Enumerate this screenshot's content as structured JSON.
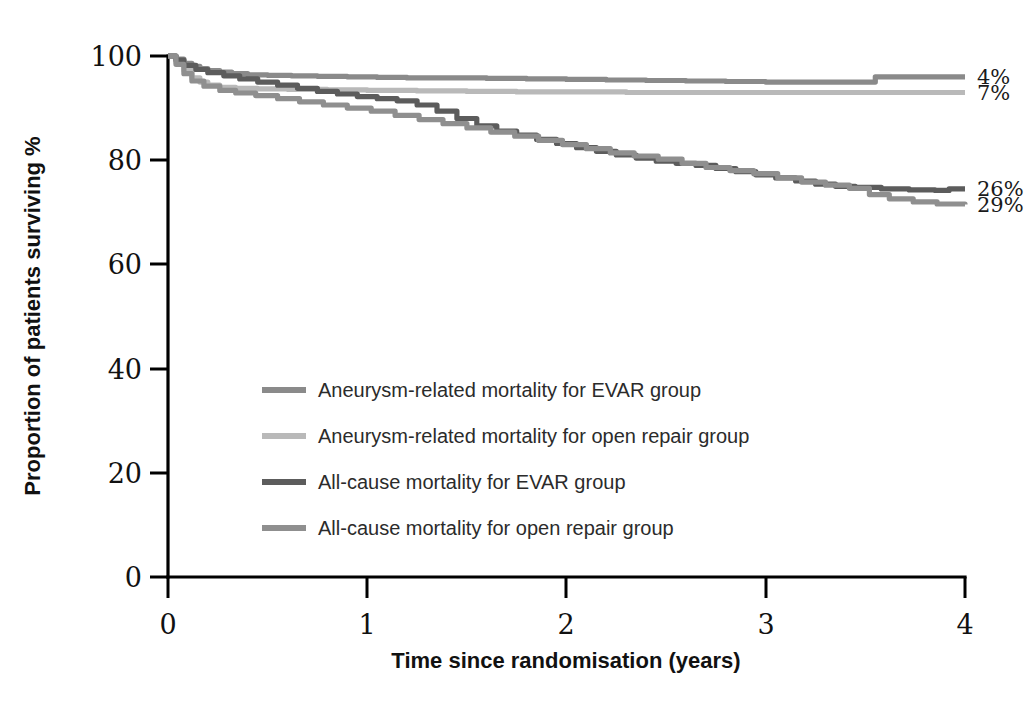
{
  "chart_data": {
    "type": "line",
    "title": "",
    "xlabel": "Time since randomisation (years)",
    "ylabel": "Proportion of patients surviving %",
    "xlim": [
      0,
      4
    ],
    "ylim": [
      0,
      100
    ],
    "xticks": [
      "0",
      "1",
      "2",
      "3",
      "4"
    ],
    "yticks": [
      "0",
      "20",
      "40",
      "60",
      "80",
      "100"
    ],
    "grid": false,
    "legend_position": "center-left",
    "series": [
      {
        "name": "Aneurysm-related mortality for EVAR group",
        "color": "#8a8a8a",
        "end_label": "4%",
        "points": [
          [
            0.0,
            100.0
          ],
          [
            0.04,
            99.4
          ],
          [
            0.08,
            98.6
          ],
          [
            0.12,
            98.0
          ],
          [
            0.16,
            97.6
          ],
          [
            0.2,
            97.2
          ],
          [
            0.26,
            96.9
          ],
          [
            0.32,
            96.6
          ],
          [
            0.4,
            96.4
          ],
          [
            0.5,
            96.3
          ],
          [
            0.62,
            96.2
          ],
          [
            0.75,
            96.1
          ],
          [
            0.9,
            96.0
          ],
          [
            1.05,
            95.9
          ],
          [
            1.2,
            95.8
          ],
          [
            1.4,
            95.8
          ],
          [
            1.6,
            95.7
          ],
          [
            1.8,
            95.6
          ],
          [
            2.0,
            95.5
          ],
          [
            2.2,
            95.4
          ],
          [
            2.4,
            95.3
          ],
          [
            2.6,
            95.2
          ],
          [
            2.8,
            95.1
          ],
          [
            3.0,
            95.0
          ],
          [
            3.3,
            95.0
          ],
          [
            3.55,
            96.0
          ],
          [
            3.8,
            96.0
          ],
          [
            4.0,
            96.0
          ]
        ]
      },
      {
        "name": "Aneurysm-related mortality for open repair group",
        "color": "#b9b9b9",
        "end_label": "7%",
        "points": [
          [
            0.0,
            100.0
          ],
          [
            0.04,
            98.8
          ],
          [
            0.08,
            97.2
          ],
          [
            0.12,
            95.8
          ],
          [
            0.16,
            95.0
          ],
          [
            0.2,
            94.4
          ],
          [
            0.26,
            94.0
          ],
          [
            0.34,
            93.8
          ],
          [
            0.45,
            93.7
          ],
          [
            0.6,
            93.6
          ],
          [
            0.8,
            93.5
          ],
          [
            1.0,
            93.4
          ],
          [
            1.25,
            93.3
          ],
          [
            1.5,
            93.2
          ],
          [
            1.75,
            93.1
          ],
          [
            2.0,
            93.1
          ],
          [
            2.3,
            93.0
          ],
          [
            2.6,
            93.0
          ],
          [
            2.9,
            93.0
          ],
          [
            3.2,
            93.0
          ],
          [
            3.5,
            93.0
          ],
          [
            3.75,
            93.0
          ],
          [
            4.0,
            93.0
          ]
        ]
      },
      {
        "name": "All-cause mortality for EVAR group",
        "color": "#5c5c5c",
        "end_label": "26%",
        "points": [
          [
            0.0,
            100.0
          ],
          [
            0.04,
            99.2
          ],
          [
            0.08,
            98.2
          ],
          [
            0.14,
            97.4
          ],
          [
            0.2,
            96.8
          ],
          [
            0.28,
            96.2
          ],
          [
            0.36,
            95.6
          ],
          [
            0.45,
            95.0
          ],
          [
            0.55,
            94.4
          ],
          [
            0.65,
            93.8
          ],
          [
            0.75,
            93.2
          ],
          [
            0.85,
            92.7
          ],
          [
            0.95,
            92.2
          ],
          [
            1.05,
            91.8
          ],
          [
            1.15,
            91.4
          ],
          [
            1.25,
            90.6
          ],
          [
            1.35,
            89.4
          ],
          [
            1.45,
            88.0
          ],
          [
            1.55,
            86.6
          ],
          [
            1.65,
            85.6
          ],
          [
            1.75,
            84.8
          ],
          [
            1.85,
            84.0
          ],
          [
            1.95,
            83.2
          ],
          [
            2.05,
            82.4
          ],
          [
            2.15,
            81.7
          ],
          [
            2.25,
            81.0
          ],
          [
            2.35,
            80.4
          ],
          [
            2.45,
            79.8
          ],
          [
            2.55,
            79.4
          ],
          [
            2.65,
            79.0
          ],
          [
            2.75,
            78.4
          ],
          [
            2.85,
            77.8
          ],
          [
            2.95,
            77.2
          ],
          [
            3.05,
            76.6
          ],
          [
            3.15,
            76.0
          ],
          [
            3.25,
            75.4
          ],
          [
            3.35,
            75.0
          ],
          [
            3.45,
            74.8
          ],
          [
            3.58,
            74.5
          ],
          [
            3.72,
            74.3
          ],
          [
            3.85,
            74.2
          ],
          [
            3.92,
            74.5
          ],
          [
            4.0,
            74.5
          ]
        ]
      },
      {
        "name": "All-cause mortality for open repair group",
        "color": "#8f8f8f",
        "end_label": "29%",
        "points": [
          [
            0.0,
            100.0
          ],
          [
            0.04,
            98.4
          ],
          [
            0.08,
            96.6
          ],
          [
            0.12,
            95.2
          ],
          [
            0.18,
            94.2
          ],
          [
            0.26,
            93.4
          ],
          [
            0.34,
            92.9
          ],
          [
            0.44,
            92.4
          ],
          [
            0.55,
            91.8
          ],
          [
            0.66,
            91.2
          ],
          [
            0.78,
            90.6
          ],
          [
            0.9,
            90.0
          ],
          [
            1.02,
            89.4
          ],
          [
            1.14,
            88.6
          ],
          [
            1.26,
            87.8
          ],
          [
            1.38,
            87.0
          ],
          [
            1.5,
            86.2
          ],
          [
            1.62,
            85.4
          ],
          [
            1.74,
            84.6
          ],
          [
            1.86,
            83.8
          ],
          [
            1.98,
            83.0
          ],
          [
            2.1,
            82.2
          ],
          [
            2.22,
            81.4
          ],
          [
            2.34,
            80.8
          ],
          [
            2.46,
            80.2
          ],
          [
            2.58,
            79.4
          ],
          [
            2.7,
            78.6
          ],
          [
            2.82,
            78.0
          ],
          [
            2.94,
            77.4
          ],
          [
            3.06,
            76.6
          ],
          [
            3.18,
            75.8
          ],
          [
            3.3,
            75.2
          ],
          [
            3.42,
            74.6
          ],
          [
            3.52,
            73.4
          ],
          [
            3.62,
            72.6
          ],
          [
            3.74,
            72.0
          ],
          [
            3.86,
            71.6
          ],
          [
            4.0,
            71.5
          ]
        ]
      }
    ],
    "end_labels": [
      {
        "text": "4%",
        "value": 96.0
      },
      {
        "text": "7%",
        "value": 93.0
      },
      {
        "text": "26%",
        "value": 74.5
      },
      {
        "text": "29%",
        "value": 71.5
      }
    ]
  },
  "axes": {
    "y_title": "Proportion of patients surviving %",
    "x_title": "Time since randomisation (years)",
    "y_ticks": [
      "100",
      "80",
      "60",
      "40",
      "20",
      "0"
    ],
    "x_ticks": [
      "0",
      "1",
      "2",
      "3",
      "4"
    ]
  },
  "legend": {
    "items": [
      {
        "label": "Aneurysm-related mortality for EVAR group",
        "color": "#8a8a8a"
      },
      {
        "label": "Aneurysm-related mortality for open repair group",
        "color": "#b9b9b9"
      },
      {
        "label": "All-cause mortality for EVAR group",
        "color": "#5c5c5c"
      },
      {
        "label": "All-cause mortality for open repair group",
        "color": "#8f8f8f"
      }
    ]
  },
  "colors": {
    "axis": "#000000",
    "text": "#1a1a1a",
    "background": "#ffffff"
  }
}
